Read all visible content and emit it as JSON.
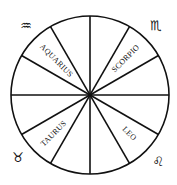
{
  "diagram": {
    "center": [
      90,
      95
    ],
    "radius": 79,
    "sectors": 12,
    "stroke_color": "#111111",
    "background": "#ffffff"
  },
  "labels": [
    {
      "text": "AQUARIUS",
      "x": 56,
      "y": 61,
      "rotate": 45
    },
    {
      "text": "SCORPIO",
      "x": 126,
      "y": 59,
      "rotate": -45
    },
    {
      "text": "TAURUS",
      "x": 54,
      "y": 134,
      "rotate": -45
    },
    {
      "text": "LEO",
      "x": 129,
      "y": 134,
      "rotate": 45
    }
  ],
  "symbols": [
    {
      "name": "aquarius",
      "glyph": "♒",
      "x": 26,
      "y": 30
    },
    {
      "name": "scorpio",
      "glyph": "♏",
      "x": 156,
      "y": 30
    },
    {
      "name": "taurus",
      "glyph": "♉",
      "x": 18,
      "y": 162
    },
    {
      "name": "leo",
      "glyph": "♌",
      "x": 158,
      "y": 166
    }
  ]
}
